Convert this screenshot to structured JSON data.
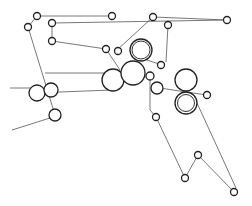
{
  "diagram": {
    "type": "web-path roller diagram",
    "colors": {
      "background": "#ffffff",
      "line": "#555555",
      "roller": "#222222"
    },
    "paths": [
      [
        [
          10,
          88
        ],
        [
          37,
          88
        ]
      ],
      [
        [
          12,
          130
        ],
        [
          50,
          118
        ]
      ],
      [
        [
          28,
          27
        ],
        [
          37,
          16
        ],
        [
          112,
          16
        ]
      ],
      [
        [
          28,
          27
        ],
        [
          55,
          115
        ]
      ],
      [
        [
          52,
          23
        ],
        [
          227,
          20
        ]
      ],
      [
        [
          52,
          23
        ],
        [
          52,
          41
        ]
      ],
      [
        [
          52,
          41
        ],
        [
          106,
          49
        ]
      ],
      [
        [
          51,
          92
        ],
        [
          60,
          92
        ],
        [
          112,
          90
        ]
      ],
      [
        [
          106,
          49
        ],
        [
          120,
          70
        ]
      ],
      [
        [
          117,
          50
        ],
        [
          153,
          17
        ],
        [
          227,
          20
        ]
      ],
      [
        [
          141,
          58
        ],
        [
          162,
          65
        ]
      ],
      [
        [
          168,
          25
        ],
        [
          166,
          62
        ]
      ],
      [
        [
          150,
          76
        ],
        [
          150,
          110
        ],
        [
          156,
          117
        ],
        [
          185,
          178
        ],
        [
          198,
          155
        ],
        [
          234,
          192
        ]
      ],
      [
        [
          160,
          88
        ],
        [
          186,
          92
        ],
        [
          207,
          95
        ]
      ],
      [
        [
          197,
          103
        ],
        [
          236,
          188
        ]
      ],
      [
        [
          133,
          73
        ],
        [
          45,
          73
        ]
      ]
    ],
    "small_rollers": [
      {
        "x": 37,
        "y": 16,
        "r": 3.5
      },
      {
        "x": 28,
        "y": 27,
        "r": 3.5
      },
      {
        "x": 52,
        "y": 23,
        "r": 3.5
      },
      {
        "x": 52,
        "y": 41,
        "r": 3.5
      },
      {
        "x": 112,
        "y": 16,
        "r": 3.5
      },
      {
        "x": 106,
        "y": 49,
        "r": 3.5
      },
      {
        "x": 118,
        "y": 51,
        "r": 3.5
      },
      {
        "x": 153,
        "y": 17,
        "r": 3.5
      },
      {
        "x": 168,
        "y": 25,
        "r": 3.5
      },
      {
        "x": 227,
        "y": 20,
        "r": 3.5
      },
      {
        "x": 161,
        "y": 65,
        "r": 3.5
      },
      {
        "x": 150,
        "y": 76,
        "r": 4
      },
      {
        "x": 207,
        "y": 95,
        "r": 3.5
      },
      {
        "x": 156,
        "y": 117,
        "r": 3.5
      },
      {
        "x": 198,
        "y": 155,
        "r": 3.5
      },
      {
        "x": 185,
        "y": 178,
        "r": 3.5
      },
      {
        "x": 234,
        "y": 192,
        "r": 3.5
      }
    ],
    "large_rollers": [
      {
        "x": 37,
        "y": 93,
        "r": 8
      },
      {
        "x": 51,
        "y": 90,
        "r": 7
      },
      {
        "x": 55,
        "y": 115,
        "r": 6
      },
      {
        "x": 113,
        "y": 80,
        "r": 11
      },
      {
        "x": 133,
        "y": 73,
        "r": 12
      },
      {
        "x": 157,
        "y": 88,
        "r": 6
      },
      {
        "x": 186,
        "y": 80,
        "r": 11
      }
    ],
    "double_rollers": [
      {
        "x": 141,
        "y": 50,
        "r": 11,
        "inner": 9
      },
      {
        "x": 186,
        "y": 103,
        "r": 11,
        "inner": 8.5
      }
    ]
  }
}
